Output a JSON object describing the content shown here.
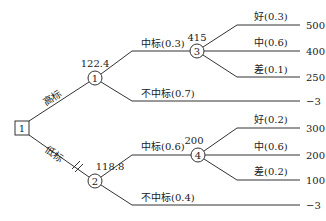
{
  "decision_tree": {
    "root": {
      "label": "1",
      "type": "decision"
    },
    "branches": [
      {
        "label": "高标",
        "pruned": false,
        "chance_node": {
          "label": "1",
          "expected_value": "122.4"
        },
        "outcomes": [
          {
            "label": "中标(0.3)",
            "chance_node": {
              "label": "3",
              "expected_value": "415"
            },
            "results": [
              {
                "label": "好(0.3)",
                "value": "500"
              },
              {
                "label": "中(0.6)",
                "value": "400"
              },
              {
                "label": "差(0.1)",
                "value": "250"
              }
            ]
          },
          {
            "label": "不中标(0.7)",
            "value": "−3"
          }
        ]
      },
      {
        "label": "低标",
        "pruned": true,
        "chance_node": {
          "label": "2",
          "expected_value": "118.8"
        },
        "outcomes": [
          {
            "label": "中标(0.6)",
            "chance_node": {
              "label": "4",
              "expected_value": "200"
            },
            "results": [
              {
                "label": "好(0.2)",
                "value": "300"
              },
              {
                "label": "中(0.6)",
                "value": "200"
              },
              {
                "label": "差(0.2)",
                "value": "100"
              }
            ]
          },
          {
            "label": "不中标(0.4)",
            "value": "−3"
          }
        ]
      }
    ]
  }
}
